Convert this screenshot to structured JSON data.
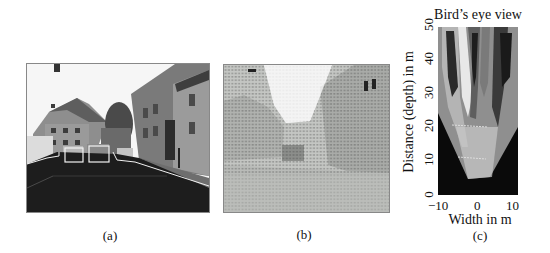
{
  "figure": {
    "panels": [
      {
        "id": "a",
        "caption": "(a)",
        "description": "Street scene camera image with road region and vehicles outlined in white"
      },
      {
        "id": "b",
        "caption": "(b)",
        "description": "Same street scene overlaid with dense grid of dark motion/disparity vectors"
      },
      {
        "id": "c",
        "caption": "(c)",
        "description": "Bird's eye view projection of the scene"
      }
    ],
    "birds_eye": {
      "title": "Bird’s eye view",
      "xlabel": "Width in m",
      "ylabel": "Distance (depth) in m",
      "xticks": [
        "−10",
        "0",
        "10"
      ],
      "yticks": [
        "0",
        "10",
        "20",
        "30",
        "40",
        "50"
      ],
      "xlim": [
        -10,
        10
      ],
      "ylim": [
        0,
        50
      ]
    }
  },
  "colors": {
    "outline": "#f2f2f2",
    "road": "#1c1c1c",
    "sky": "#f7f7f7",
    "vector": "#333333",
    "bev_background": "#0a0a0a"
  }
}
